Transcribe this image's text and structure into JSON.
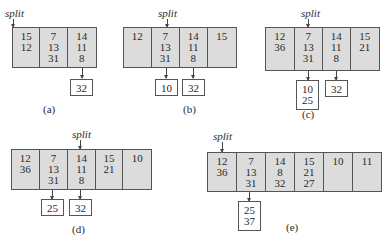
{
  "split_label": "split",
  "panels": {
    "a": {
      "caption": "(a)",
      "buckets": [
        [
          "15",
          "12",
          ""
        ],
        [
          "7",
          "13",
          "31"
        ],
        [
          "14",
          "11",
          "8"
        ]
      ],
      "overflow": {
        "b2": [
          "32"
        ]
      }
    },
    "b": {
      "caption": "(b)",
      "buckets": [
        [
          "12",
          "",
          ""
        ],
        [
          "7",
          "13",
          "31"
        ],
        [
          "14",
          "11",
          "8"
        ],
        [
          "15",
          "",
          ""
        ]
      ],
      "overflow": {
        "b1": [
          "10"
        ],
        "b2": [
          "32"
        ]
      }
    },
    "c": {
      "caption": "(c)",
      "buckets": [
        [
          "12",
          "36",
          ""
        ],
        [
          "7",
          "13",
          "31"
        ],
        [
          "14",
          "11",
          "8"
        ],
        [
          "15",
          "21",
          ""
        ]
      ],
      "overflow": {
        "b1": [
          "10",
          "25"
        ],
        "b2": [
          "32"
        ]
      }
    },
    "d": {
      "caption": "(d)",
      "buckets": [
        [
          "12",
          "36",
          ""
        ],
        [
          "7",
          "13",
          "31"
        ],
        [
          "14",
          "11",
          "8"
        ],
        [
          "15",
          "21",
          ""
        ],
        [
          "10",
          "",
          ""
        ]
      ],
      "overflow": {
        "b1": [
          "25"
        ],
        "b2": [
          "32"
        ]
      }
    },
    "e": {
      "caption": "(e)",
      "buckets": [
        [
          "12",
          "36",
          ""
        ],
        [
          "7",
          "13",
          "31"
        ],
        [
          "14",
          "8",
          "32"
        ],
        [
          "15",
          "21",
          "27"
        ],
        [
          "10",
          "",
          ""
        ],
        [
          "11",
          "",
          ""
        ]
      ],
      "overflow": {
        "b1": [
          "25",
          "37"
        ]
      }
    }
  }
}
